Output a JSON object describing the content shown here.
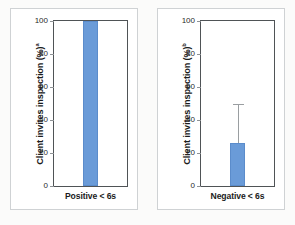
{
  "figure": {
    "background_color": "#fbfbfa",
    "panel_border_color": "#cfd2d4",
    "bar_color": "#6a9bd8",
    "error_bar_color": "#9a9ea1",
    "axis_color": "#4f5356"
  },
  "chart_data": [
    {
      "type": "bar",
      "panel_label": "a",
      "title": "",
      "xlabel": "Positive < 6s",
      "ylabel": "Client invites inspection (%)",
      "categories": [
        "Positive < 6s"
      ],
      "values": [
        100
      ],
      "errors": [
        0
      ],
      "yticks": [
        0,
        20,
        40,
        60,
        80,
        100
      ],
      "ytick_labels": [
        "0",
        "20",
        "40",
        "60",
        "80",
        "100"
      ],
      "ylim": [
        0,
        100
      ],
      "grid": false,
      "legend": "none"
    },
    {
      "type": "bar",
      "panel_label": "b",
      "title": "",
      "xlabel": "Negative < 6s",
      "ylabel": "Client invites inspection (%)",
      "categories": [
        "Negative < 6s"
      ],
      "values": [
        26
      ],
      "errors": [
        24
      ],
      "error_upper": [
        50
      ],
      "yticks": [
        0,
        20,
        40,
        60,
        80,
        100
      ],
      "ytick_labels": [
        "0",
        "20",
        "40",
        "60",
        "80",
        "100"
      ],
      "ylim": [
        0,
        100
      ],
      "grid": false,
      "legend": "none"
    }
  ]
}
